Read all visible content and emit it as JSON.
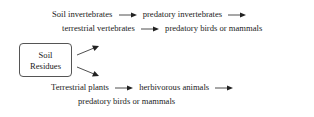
{
  "diagram": {
    "top_chain": {
      "line1": [
        "Soil invertebrates",
        "predatory invertebrates"
      ],
      "line2": [
        "terrestrial vertebrates",
        "predatory birds or mammals"
      ]
    },
    "source_box": {
      "line1": "Soil",
      "line2": "Residues"
    },
    "bottom_chain": {
      "line1": [
        "Terrestrial plants",
        "herbivorous animals"
      ],
      "line2": [
        "predatory birds or mammals"
      ]
    },
    "arrow_symbol": "arrow-right"
  }
}
